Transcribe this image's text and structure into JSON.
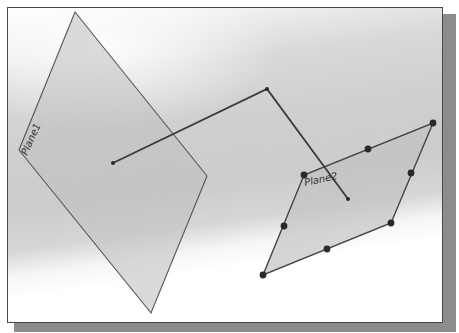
{
  "diagram": {
    "type": "3d-sketch-viewport",
    "colors": {
      "frame": "#4a4a4a",
      "shadow": "#8c8c8c",
      "plane_fill": "#c4c4c4",
      "edge": "#505050",
      "polyline": "#3a3a3a",
      "point": "#2a2a2a"
    },
    "planes": [
      {
        "id": "plane1",
        "label": "Plane1",
        "vertices": [
          [
            75,
            12
          ],
          [
            207,
            176
          ],
          [
            151,
            313
          ],
          [
            19,
            150
          ]
        ]
      },
      {
        "id": "plane2",
        "label": "Plane2",
        "vertices": [
          [
            433,
            123
          ],
          [
            391,
            223
          ],
          [
            263,
            275
          ],
          [
            304,
            175
          ]
        ],
        "points": [
          [
            433,
            123
          ],
          [
            368,
            149
          ],
          [
            304,
            175
          ],
          [
            284,
            226
          ],
          [
            263,
            275
          ],
          [
            327,
            249
          ],
          [
            391,
            223
          ],
          [
            411,
            173
          ]
        ]
      }
    ],
    "polyline": {
      "points": [
        [
          113,
          163
        ],
        [
          267,
          89
        ],
        [
          348,
          199
        ]
      ]
    }
  }
}
